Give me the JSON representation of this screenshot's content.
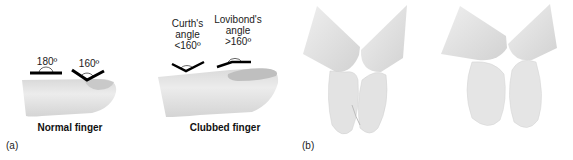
{
  "panel_a": {
    "label": "(a)",
    "normal": {
      "caption": "Normal finger",
      "angle_left": "180º",
      "angle_right": "160º"
    },
    "clubbed": {
      "caption": "Clubbed finger",
      "curth_line1": "Curth's",
      "curth_line2": "angle",
      "curth_line3": "<160º",
      "lovibond_line1": "Lovibond's",
      "lovibond_line2": "angle",
      "lovibond_line3": ">160º"
    }
  },
  "panel_b": {
    "label": "(b)"
  },
  "colors": {
    "finger": "#e6e6e6",
    "finger_shadow": "#cfcfcf",
    "nail": "#c4c4c4",
    "line": "#000000"
  }
}
